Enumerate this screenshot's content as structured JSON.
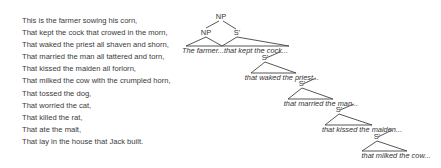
{
  "poem": {
    "lines": [
      "This is the farmer sowing his corn,",
      "That kept the cock that crowed in the morn,",
      "That waked the priest all shaven and shorn,",
      "That married the man all tattered and torn,",
      "That kissed the maiden all forlorn,",
      "That milked the cow with the crumpled horn,",
      "That tossed the dog,",
      "That worried the cat,",
      "That killed the rat,",
      "That ate the malt,",
      "That lay in the house that Jack built."
    ]
  },
  "tree": {
    "root": "NP",
    "np_child": "NP",
    "sbar_label": "S'",
    "leaves": [
      "The farmer...",
      "that kept the cock...",
      "that waked the priest...",
      "that married the man...",
      "that kissed the maiden...",
      "that milked the cow..."
    ],
    "sbar_nodes": [
      "S'",
      "S'",
      "S'",
      "S'",
      "S'"
    ]
  }
}
